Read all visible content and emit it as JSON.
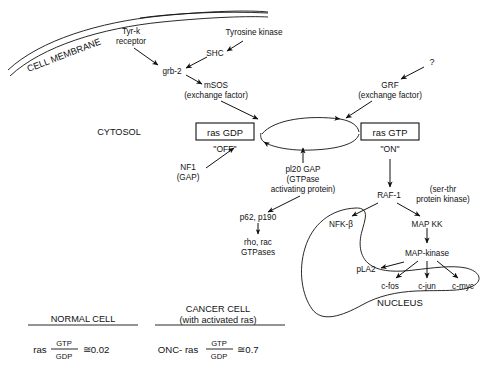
{
  "diagram": {
    "compartments": {
      "membrane": "CELL MEMBRANE",
      "cytosol": "CYTOSOL",
      "nucleus": "NUCLEUS"
    },
    "nodes": {
      "tyr_k_receptor_line1": "Tyr-k",
      "tyr_k_receptor_line2": "receptor",
      "tyrosine_kinase": "Tyrosine kinase",
      "shc": "SHC",
      "grb2": "grb-2",
      "msos_line1": "mSOS",
      "msos_line2": "(exchange factor)",
      "question_mark": "?",
      "grf_line1": "GRF",
      "grf_line2": "(exchange factor)",
      "ras_gdp": "ras GDP",
      "ras_gdp_state": "\"OFF\"",
      "ras_gtp": "ras GTP",
      "ras_gtp_state": "\"ON\"",
      "nf1_line1": "NF1",
      "nf1_line2": "(GAP)",
      "p120gap_line1": "pl20 GAP",
      "p120gap_line2": "(GTPase",
      "p120gap_line3": "activating protein)",
      "p62_p190": "p62, p190",
      "rho_rac_line1": "rho, rac",
      "rho_rac_line2": "GTPases",
      "raf1": "RAF-1",
      "ser_thr_line1": "(ser-thr",
      "ser_thr_line2": "protein kinase)",
      "nfkb": "NFK-β",
      "map_kk": "MAP KK",
      "map_kinase": "MAP-kinase",
      "pla2": "pLA2",
      "c_fos": "c-fos",
      "c_jun": "c-jun",
      "c_myc": "c-myc"
    },
    "comparison": {
      "normal": {
        "heading": "NORMAL CELL",
        "prefix": "ras",
        "numerator": "GTP",
        "denominator": "GDP",
        "value": "≅0.02"
      },
      "cancer": {
        "heading_line1": "CANCER CELL",
        "heading_line2": "(with activated ras)",
        "prefix": "ONC- ras",
        "numerator": "GTP",
        "denominator": "GDP",
        "value": "≅0.7"
      }
    },
    "colors": {
      "ink": "#111111",
      "paper": "#ffffff"
    }
  }
}
